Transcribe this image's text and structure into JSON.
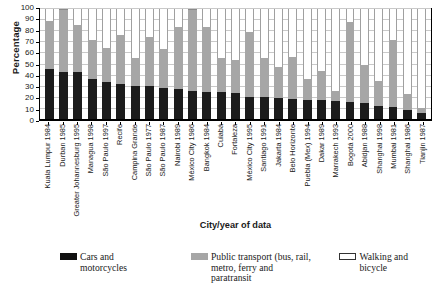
{
  "chart_data": {
    "type": "bar",
    "subtype": "stacked-bar-100",
    "title": "",
    "xlabel": "City/year of data",
    "ylabel": "Percentage",
    "ylim": [
      0,
      100
    ],
    "yticks": [
      0,
      10,
      20,
      30,
      40,
      50,
      60,
      70,
      80,
      90,
      100
    ],
    "grid": true,
    "legend_position": "bottom",
    "categories": [
      "Kuala Lumpur 1984",
      "Durban 1985",
      "Greater Johannesburg 1995",
      "Managua 1998",
      "São Paulo 1997",
      "Recife",
      "Campina Grande",
      "São Paulo 1977",
      "São Paulo 1987",
      "Nairobi 1989",
      "México City 1986",
      "Bangkok 1984",
      "Cuiabá",
      "Fortaleza",
      "México City 1995",
      "Santiago 1991",
      "Jakarta 1984",
      "Belo Horizonte",
      "Puebla (Mex) 1994",
      "Dakar 1989",
      "Marrakech 1993",
      "Bogotá 2000",
      "Abidjan 1988",
      "Shanghai 1998",
      "Mumbai 1981",
      "Shanghai 1986",
      "Tianjin 1987"
    ],
    "series": [
      {
        "name": "Cars and motorcycles",
        "color": "#1c1c1c",
        "values": [
          46,
          43,
          43,
          37,
          34,
          32,
          31,
          31,
          29,
          28,
          26,
          25,
          25,
          24,
          21,
          21,
          20,
          19,
          18,
          18,
          17,
          16,
          15,
          13,
          12,
          9,
          6
        ]
      },
      {
        "name": "Public transport (bus, rail, metro, ferry and paratransit",
        "color": "#a6a6a6",
        "values": [
          43,
          57,
          43,
          35,
          31,
          45,
          25,
          44,
          35,
          56,
          74,
          59,
          31,
          30,
          58,
          35,
          28,
          38,
          19,
          26,
          9,
          72,
          35,
          22,
          60,
          14,
          5
        ]
      },
      {
        "name": "Walking and bicycle",
        "color": "#ffffff",
        "values": [
          11,
          0,
          14,
          28,
          35,
          23,
          44,
          25,
          36,
          16,
          0,
          16,
          44,
          46,
          21,
          44,
          52,
          43,
          63,
          56,
          74,
          12,
          50,
          65,
          28,
          77,
          89
        ]
      }
    ]
  },
  "legend": {
    "items": [
      {
        "label": "Cars and motorcycles",
        "swatch": "cars"
      },
      {
        "label": "Public transport (bus, rail, metro, ferry and paratransit",
        "swatch": "transit"
      },
      {
        "label": "Walking and bicycle",
        "swatch": "walk"
      }
    ],
    "transit_line1": "Public transport (bus, rail,",
    "transit_line2": "metro, ferry and paratransit"
  },
  "footnote": ""
}
